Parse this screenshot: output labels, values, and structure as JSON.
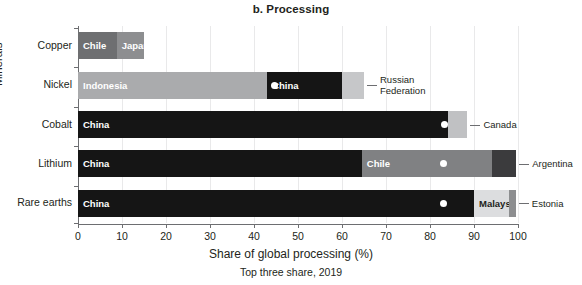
{
  "chart_data": {
    "type": "bar",
    "orientation": "horizontal",
    "stacked": true,
    "title": "b. Processing",
    "subtitle": "Top three share, 2019",
    "xlabel": "Share of global processing (%)",
    "ylabel": "Minerals",
    "xlim": [
      0,
      100
    ],
    "xticks": [
      0,
      10,
      20,
      30,
      40,
      50,
      60,
      70,
      80,
      90,
      100
    ],
    "xtick_labels": [
      "0",
      "10",
      "20",
      "30",
      "40",
      "50",
      "60",
      "70",
      "80",
      "90",
      "100"
    ],
    "grid": "vertical",
    "legend": "none-inline-labels",
    "categories": [
      "Copper",
      "Nickel",
      "Cobalt",
      "Lithium",
      "Rare earths"
    ],
    "rows": [
      {
        "category": "Copper",
        "total": 15.0,
        "segments": [
          {
            "name": "Chile",
            "value": 8.8,
            "start": 0.0,
            "end": 8.8,
            "color": "#6e6f71",
            "label_inside": true,
            "label_align": "left",
            "label_color": "light",
            "marker": false
          },
          {
            "name": "Japan",
            "value": 6.2,
            "start": 8.8,
            "end": 15.0,
            "color": "#8d8e90",
            "label_inside": true,
            "label_align": "left",
            "label_color": "light",
            "marker": false
          }
        ]
      },
      {
        "category": "Nickel",
        "total": 65.0,
        "segments": [
          {
            "name": "Indonesia",
            "value": 43.0,
            "start": 0.0,
            "end": 43.0,
            "color": "#aaabad",
            "label_inside": true,
            "label_align": "left",
            "label_color": "light",
            "marker": false
          },
          {
            "name": "China",
            "value": 17.0,
            "start": 43.0,
            "end": 60.0,
            "color": "#151515",
            "label_inside": true,
            "label_align": "left",
            "label_color": "light",
            "marker": true,
            "marker_at": 44.7
          },
          {
            "name": "Russian Federation",
            "value": 5.0,
            "start": 60.0,
            "end": 65.0,
            "color": "#c6c7c9",
            "label_inside": false,
            "label_align": "callout",
            "label_color": "dark",
            "marker": false
          }
        ]
      },
      {
        "category": "Cobalt",
        "total": 88.5,
        "segments": [
          {
            "name": "China",
            "value": 82.0,
            "start": 0.0,
            "end": 82.0,
            "color": "#151515",
            "label_inside": true,
            "label_align": "left",
            "label_color": "light",
            "marker": false
          },
          {
            "name": "Finland",
            "value": 2.0,
            "start": 82.0,
            "end": 84.0,
            "color": "#151515",
            "label_inside": true,
            "label_align": "right",
            "label_color": "light",
            "marker": true,
            "marker_at": 83.2
          },
          {
            "name": "Canada",
            "value": 4.5,
            "start": 84.0,
            "end": 88.5,
            "color": "#c0c1c3",
            "label_inside": false,
            "label_align": "callout",
            "label_color": "dark",
            "marker": false
          }
        ]
      },
      {
        "category": "Lithium",
        "total": 99.6,
        "segments": [
          {
            "name": "China",
            "value": 64.5,
            "start": 0.0,
            "end": 64.5,
            "color": "#151515",
            "label_inside": true,
            "label_align": "left",
            "label_color": "light",
            "marker": false
          },
          {
            "name": "Chile",
            "value": 29.5,
            "start": 64.5,
            "end": 94.0,
            "color": "#808183",
            "label_inside": true,
            "label_align": "left",
            "label_color": "light",
            "marker": true,
            "marker_at": 83.0
          },
          {
            "name": "Argentina",
            "value": 5.6,
            "start": 94.0,
            "end": 99.6,
            "color": "#3b3b3d",
            "label_inside": false,
            "label_align": "callout",
            "label_color": "dark",
            "marker": false
          }
        ]
      },
      {
        "category": "Rare earths",
        "total": 99.5,
        "segments": [
          {
            "name": "China",
            "value": 90.0,
            "start": 0.0,
            "end": 90.0,
            "color": "#151515",
            "label_inside": true,
            "label_align": "left",
            "label_color": "light",
            "marker": true,
            "marker_at": 83.0
          },
          {
            "name": "Malaysia",
            "value": 8.0,
            "start": 90.0,
            "end": 98.0,
            "color": "#dcdddf",
            "label_inside": true,
            "label_align": "left",
            "label_color": "dark",
            "marker": false
          },
          {
            "name": "Estonia",
            "value": 1.5,
            "start": 98.0,
            "end": 99.5,
            "color": "#8d8e90",
            "label_inside": false,
            "label_align": "callout",
            "label_color": "dark",
            "marker": false
          }
        ]
      }
    ],
    "callouts": [
      {
        "text": "Russian Federation",
        "row": "Nickel",
        "wrap": [
          "Russian",
          "Federation"
        ]
      },
      {
        "text": "Canada",
        "row": "Cobalt",
        "wrap": [
          "Canada"
        ]
      },
      {
        "text": "Argentina",
        "row": "Lithium",
        "wrap": [
          "Argentina"
        ]
      },
      {
        "text": "Estonia",
        "row": "Rare earths",
        "wrap": [
          "Estonia"
        ]
      }
    ],
    "colors": {
      "black": "#151515",
      "dark_gray": "#3b3b3d",
      "mid_gray": "#6e6f71",
      "gray": "#808183",
      "light_gray": "#aaabad",
      "lighter_gray": "#c6c7c9",
      "lightest_gray": "#dcdddf",
      "axis": "#6d6e71",
      "grid": "#e9e9ea",
      "text": "#231f20",
      "marker": "#ffffff"
    }
  }
}
